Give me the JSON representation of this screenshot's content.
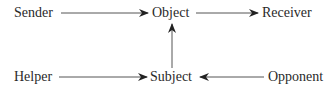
{
  "diagram": {
    "type": "actantial-model",
    "nodes": {
      "sender": "Sender",
      "object": "Object",
      "receiver": "Receiver",
      "helper": "Helper",
      "subject": "Subject",
      "opponent": "Opponent"
    },
    "edges": [
      {
        "from": "Sender",
        "to": "Object"
      },
      {
        "from": "Object",
        "to": "Receiver"
      },
      {
        "from": "Subject",
        "to": "Object"
      },
      {
        "from": "Helper",
        "to": "Subject"
      },
      {
        "from": "Opponent",
        "to": "Subject"
      }
    ],
    "colors": {
      "text": "#2a2a2a",
      "line": "#555555",
      "arrowhead": "#222222"
    }
  }
}
